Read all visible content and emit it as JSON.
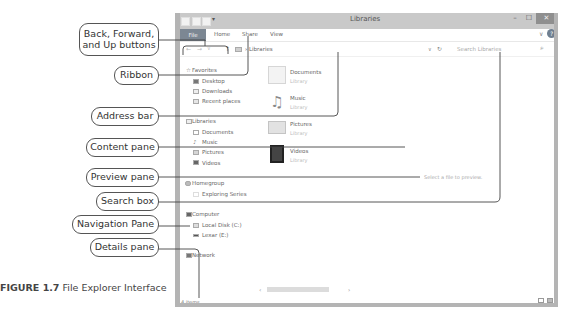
{
  "window": {
    "title": "Libraries",
    "titlebar_buttons": {
      "minimize": "–",
      "maximize": "☐",
      "close": "✕"
    },
    "ribbon_tabs": [
      "File",
      "Home",
      "Share",
      "View"
    ],
    "ribbon_expand": "∨",
    "help": "?",
    "address": {
      "back": "←",
      "forward": "→",
      "recent": "∨",
      "up": "↑",
      "path_separator": "›",
      "path": "Libraries",
      "dropdown": "∨",
      "refresh": "↻"
    },
    "search": {
      "placeholder": "Search Libraries",
      "icon": "⌕"
    },
    "navigation": {
      "favorites": {
        "label": "Favorites",
        "icon": "☆",
        "items": [
          "Desktop",
          "Downloads",
          "Recent places"
        ]
      },
      "libraries": {
        "label": "Libraries",
        "items": [
          "Documents",
          "Music",
          "Pictures",
          "Videos"
        ]
      },
      "homegroup": {
        "label": "Homegroup",
        "items": [
          "Exploring Series"
        ]
      },
      "computer": {
        "label": "Computer",
        "items": [
          "Local Disk (C:)",
          "Lexar (E:)"
        ]
      },
      "network": {
        "label": "Network"
      }
    },
    "content": [
      {
        "name": "Documents",
        "type": "Library"
      },
      {
        "name": "Music",
        "type": "Library"
      },
      {
        "name": "Pictures",
        "type": "Library"
      },
      {
        "name": "Videos",
        "type": "Library"
      }
    ],
    "preview_text": "Select a file to preview.",
    "status": "4 items",
    "scroll": {
      "left": "‹",
      "right": "›"
    }
  },
  "callouts": {
    "back_forward_line1": "Back, Forward,",
    "back_forward_line2": "and Up buttons",
    "ribbon": "Ribbon",
    "address_bar": "Address bar",
    "content_pane": "Content pane",
    "preview_pane": "Preview pane",
    "search_box": "Search box",
    "navigation_pane": "Navigation Pane",
    "details_pane": "Details pane"
  },
  "caption": {
    "figure_number": "FIGURE 1.7",
    "text": " File Explorer Interface"
  }
}
